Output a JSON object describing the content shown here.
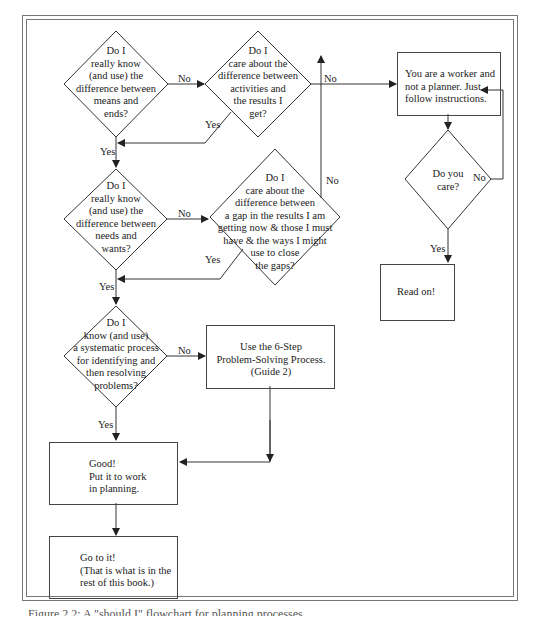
{
  "diagram": {
    "decisions": {
      "means_ends": "Do I\nreally know\n(and use) the\ndifference between\nmeans and\nends?",
      "activities_results": "Do I\ncare about  the\ndifference between\nactivities and\nthe results I\nget?",
      "needs_wants": "Do I\nreally know\n(and use) the\ndifference between\nneeds and\nwants?",
      "gap": "Do I\ncare about the\ndifference between\na gap in the results I am\ngetting now & those I must\nhave & the ways I might\nuse to close\nthe gaps?",
      "systematic": "Do I\nknow (and use)\na systematic process\nfor identifying and\nthen resolving\nproblems?",
      "do_you_care": "Do you\ncare?"
    },
    "boxes": {
      "worker": "You are a worker and\nnot a planner.  Just\nfollow instructions.",
      "read_on": "Read on!",
      "six_step": "Use the 6-Step\nProblem-Solving Process.\n(Guide 2)",
      "good": "Good!\nPut it to work\nin planning.",
      "go_to_it": "Go to it!\n(That is what is in the\nrest of this book.)"
    },
    "edge_labels": {
      "yes": "Yes",
      "no": "No"
    },
    "caption": "Figure 2.2: A \"should I\" flowchart for planning processes"
  }
}
